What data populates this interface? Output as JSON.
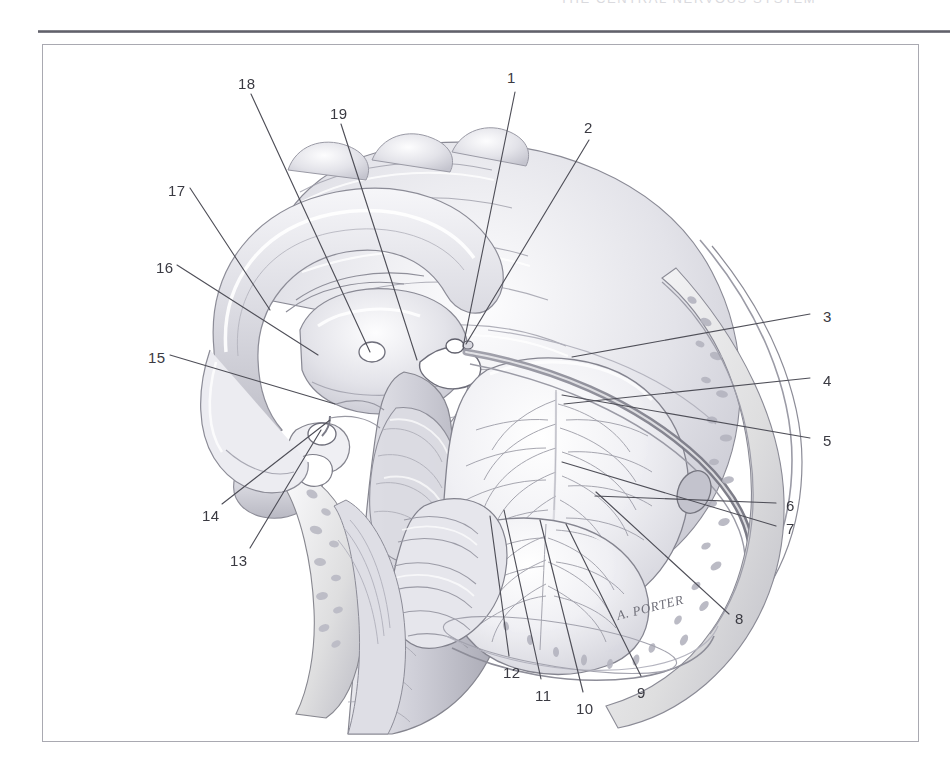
{
  "page": {
    "width": 950,
    "height": 773,
    "background_color": "#ffffff",
    "running_head": "THE CENTRAL NERVOUS SYSTEM"
  },
  "frame": {
    "rule_color": "#5d5d66",
    "border_color": "#a9a9b1"
  },
  "figure": {
    "kind": "anatomical-illustration",
    "style": "graphite pencil / airbrush halftone, grayscale",
    "signature": "A. PORTER",
    "ink_color": "#4a4a52",
    "tone_light": "#f2f2f4",
    "tone_mid": "#cfcfd6",
    "tone_dark": "#8e8e99"
  },
  "callouts": [
    {
      "id": "1",
      "label": "1",
      "x": 507,
      "y": 70,
      "leader": [
        [
          515,
          92
        ],
        [
          463,
          347
        ]
      ]
    },
    {
      "id": "2",
      "label": "2",
      "x": 584,
      "y": 120,
      "leader": [
        [
          589,
          140
        ],
        [
          466,
          344
        ]
      ]
    },
    {
      "id": "3",
      "label": "3",
      "x": 823,
      "y": 309,
      "leader": [
        [
          818,
          316
        ],
        [
          572,
          357
        ]
      ]
    },
    {
      "id": "4",
      "label": "4",
      "x": 823,
      "y": 373,
      "leader": [
        [
          818,
          380
        ],
        [
          564,
          404
        ]
      ]
    },
    {
      "id": "5",
      "label": "5",
      "x": 823,
      "y": 433,
      "leader": [
        [
          818,
          440
        ],
        [
          562,
          395
        ]
      ]
    },
    {
      "id": "6",
      "label": "6",
      "x": 786,
      "y": 498,
      "leader": [
        [
          781,
          505
        ],
        [
          595,
          496
        ]
      ]
    },
    {
      "id": "7",
      "label": "7",
      "x": 786,
      "y": 521,
      "leader": [
        [
          781,
          528
        ],
        [
          562,
          462
        ]
      ]
    },
    {
      "id": "8",
      "label": "8",
      "x": 735,
      "y": 611,
      "leader": [
        [
          731,
          616
        ],
        [
          596,
          492
        ]
      ]
    },
    {
      "id": "9",
      "label": "9",
      "x": 637,
      "y": 685,
      "leader": [
        [
          640,
          678
        ],
        [
          566,
          524
        ]
      ]
    },
    {
      "id": "10",
      "label": "10",
      "x": 578,
      "y": 701,
      "leader": [
        [
          582,
          694
        ],
        [
          540,
          520
        ]
      ]
    },
    {
      "id": "11",
      "label": "11",
      "x": 537,
      "y": 688,
      "leader": [
        [
          540,
          681
        ],
        [
          504,
          510
        ]
      ]
    },
    {
      "id": "12",
      "label": "12",
      "x": 505,
      "y": 665,
      "leader": [
        [
          508,
          658
        ],
        [
          490,
          516
        ]
      ]
    },
    {
      "id": "13",
      "label": "13",
      "x": 230,
      "y": 553,
      "leader": [
        [
          248,
          549
        ],
        [
          321,
          430
        ]
      ]
    },
    {
      "id": "14",
      "label": "14",
      "x": 202,
      "y": 508,
      "leader": [
        [
          220,
          505
        ],
        [
          330,
          420
        ]
      ]
    },
    {
      "id": "15",
      "label": "15",
      "x": 148,
      "y": 350,
      "leader": [
        [
          168,
          356
        ],
        [
          335,
          404
        ]
      ]
    },
    {
      "id": "16",
      "label": "16",
      "x": 156,
      "y": 260,
      "leader": [
        [
          175,
          266
        ],
        [
          318,
          355
        ]
      ]
    },
    {
      "id": "17",
      "label": "17",
      "x": 168,
      "y": 183,
      "leader": [
        [
          188,
          189
        ],
        [
          270,
          310
        ]
      ]
    },
    {
      "id": "18",
      "label": "18",
      "x": 238,
      "y": 76,
      "leader": [
        [
          250,
          93
        ],
        [
          370,
          352
        ]
      ]
    },
    {
      "id": "19",
      "label": "19",
      "x": 330,
      "y": 106,
      "leader": [
        [
          340,
          123
        ],
        [
          417,
          360
        ]
      ]
    }
  ]
}
